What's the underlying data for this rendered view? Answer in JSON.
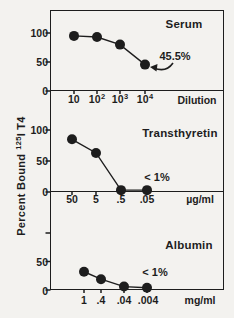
{
  "page": {
    "background": "#f3f2ef",
    "ink": "#1d1d1d"
  },
  "y_axis_label": {
    "prefix": "Percent Bound ",
    "sup": "125",
    "suffix": "I T4"
  },
  "chart_data": [
    {
      "type": "line",
      "title": "Serum",
      "x_unit": "Dilution",
      "x_ticks": [
        {
          "base": "10",
          "sup": ""
        },
        {
          "base": "10",
          "sup": "2"
        },
        {
          "base": "10",
          "sup": "3"
        },
        {
          "base": "10",
          "sup": "4"
        }
      ],
      "y_ticks": [
        {
          "label": "100",
          "value": 100
        },
        {
          "label": "50",
          "value": 50
        },
        {
          "label": "0",
          "value": 0
        }
      ],
      "values": [
        95,
        93,
        80,
        45.5
      ],
      "ylim": [
        0,
        100
      ],
      "grid": false,
      "annotation": "45.5%"
    },
    {
      "type": "line",
      "title": "Transthyretin",
      "x_unit": "µg/ml",
      "x_ticks": [
        {
          "base": "50",
          "sup": ""
        },
        {
          "base": "5",
          "sup": ""
        },
        {
          "base": ".5",
          "sup": ""
        },
        {
          "base": ".05",
          "sup": ""
        }
      ],
      "y_ticks": [
        {
          "label": "100",
          "value": 100
        },
        {
          "label": "50",
          "value": 50
        },
        {
          "label": "0",
          "value": 0
        }
      ],
      "values": [
        85,
        63,
        3,
        3
      ],
      "ylim": [
        0,
        100
      ],
      "grid": false,
      "annotation": "< 1%"
    },
    {
      "type": "line",
      "title": "Albumin",
      "x_unit": "mg/ml",
      "x_ticks": [
        {
          "base": "1",
          "sup": ""
        },
        {
          "base": ".4",
          "sup": ""
        },
        {
          "base": ".04",
          "sup": ""
        },
        {
          "base": ".004",
          "sup": ""
        }
      ],
      "y_ticks": [
        {
          "label": "",
          "value": 100
        },
        {
          "label": "50",
          "value": 50
        },
        {
          "label": "0",
          "value": 0
        }
      ],
      "values": [
        32,
        19,
        6,
        4
      ],
      "ylim": [
        0,
        100
      ],
      "grid": false,
      "annotation": "< 1%"
    }
  ]
}
